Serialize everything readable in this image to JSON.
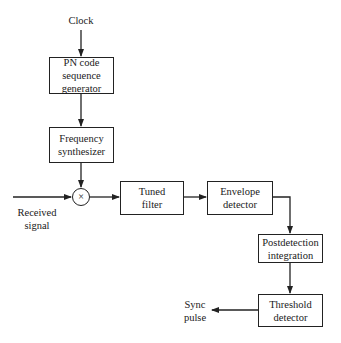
{
  "diagram": {
    "type": "block-diagram",
    "inputs": {
      "clock": "Clock",
      "received_signal": "Received\nsignal"
    },
    "blocks": [
      {
        "id": "pn",
        "label": "PN code sequence generator",
        "lines": [
          "PN code",
          "sequence",
          "generator"
        ]
      },
      {
        "id": "freq",
        "label": "Frequency synthesizer",
        "lines": [
          "Frequency",
          "synthesizer"
        ]
      },
      {
        "id": "tuned",
        "label": "Tuned filter",
        "lines": [
          "Tuned",
          "filter"
        ]
      },
      {
        "id": "env",
        "label": "Envelope detector",
        "lines": [
          "Envelope",
          "detector"
        ]
      },
      {
        "id": "post",
        "label": "Postdetection integration",
        "lines": [
          "Postdetection",
          "integration"
        ]
      },
      {
        "id": "thresh",
        "label": "Threshold detector",
        "lines": [
          "Threshold",
          "detector"
        ]
      }
    ],
    "mixer": {
      "symbol": "×"
    },
    "outputs": {
      "sync_pulse": [
        "Sync",
        "pulse"
      ]
    },
    "connections": [
      [
        "Clock",
        "pn"
      ],
      [
        "pn",
        "freq"
      ],
      [
        "freq",
        "mixer"
      ],
      [
        "Received signal",
        "mixer"
      ],
      [
        "mixer",
        "tuned"
      ],
      [
        "tuned",
        "env"
      ],
      [
        "env",
        "post"
      ],
      [
        "post",
        "thresh"
      ],
      [
        "thresh",
        "Sync pulse"
      ]
    ]
  }
}
